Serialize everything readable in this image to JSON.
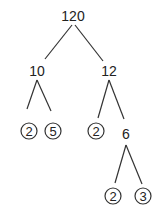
{
  "diagram": {
    "type": "factor-tree",
    "nodes": {
      "root": {
        "label": "120"
      },
      "left": {
        "label": "10"
      },
      "right": {
        "label": "12"
      },
      "left_left": {
        "label": "2",
        "circled": true
      },
      "left_right": {
        "label": "5",
        "circled": true
      },
      "right_left": {
        "label": "2",
        "circled": true
      },
      "right_right": {
        "label": "6"
      },
      "rr_left": {
        "label": "2",
        "circled": true
      },
      "rr_right": {
        "label": "3",
        "circled": true
      }
    },
    "edges": [
      [
        "root",
        "left"
      ],
      [
        "root",
        "right"
      ],
      [
        "left",
        "left_left"
      ],
      [
        "left",
        "left_right"
      ],
      [
        "right",
        "right_left"
      ],
      [
        "right",
        "right_right"
      ],
      [
        "right_right",
        "rr_left"
      ],
      [
        "right_right",
        "rr_right"
      ]
    ]
  }
}
